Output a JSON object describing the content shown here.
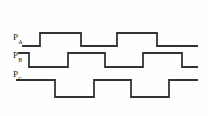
{
  "figure": {
    "background_color": "#fefefe",
    "line_color": "#333333",
    "line_width": 1.8
  },
  "signals": [
    {
      "id": "PA",
      "label_base": "P",
      "label_sub": "A",
      "label_x": 13,
      "label_y": 33,
      "high_y": 33,
      "low_y": 46,
      "x_start": 22,
      "x_end": 198,
      "initial_level": "low",
      "transitions": [
        {
          "x": 40,
          "to": "high"
        },
        {
          "x": 81,
          "to": "low"
        },
        {
          "x": 117,
          "to": "high"
        },
        {
          "x": 157,
          "to": "low"
        }
      ],
      "path": "M 22 46 L 40 46 L 40 33 L 81 33 L 81 46 L 117 46 L 117 33 L 157 33 L 157 46 L 198 46"
    },
    {
      "id": "PB",
      "label_base": "P",
      "label_sub": "B",
      "label_x": 13,
      "label_y": 51,
      "high_y": 53,
      "low_y": 67,
      "x_start": 18,
      "x_end": 198,
      "initial_level": "high",
      "transitions": [
        {
          "x": 29,
          "to": "low"
        },
        {
          "x": 68,
          "to": "high"
        },
        {
          "x": 105,
          "to": "low"
        },
        {
          "x": 143,
          "to": "high"
        },
        {
          "x": 182,
          "to": "low"
        }
      ],
      "path": "M 18 53 L 29 53 L 29 67 L 68 67 L 68 53 L 105 53 L 105 67 L 143 67 L 143 53 L 182 53 L 182 67 L 198 67"
    },
    {
      "id": "PC",
      "label_base": "P",
      "label_sub": "C",
      "label_x": 13,
      "label_y": 70,
      "high_y": 80,
      "low_y": 97,
      "x_start": 16,
      "x_end": 198,
      "initial_level": "high",
      "transitions": [
        {
          "x": 55,
          "to": "low"
        },
        {
          "x": 94,
          "to": "high"
        },
        {
          "x": 131,
          "to": "low"
        },
        {
          "x": 169,
          "to": "high"
        }
      ],
      "path": "M 16 80 L 55 80 L 55 97 L 94 97 L 94 80 L 131 80 L 131 97 L 169 97 L 169 80 L 198 80"
    }
  ]
}
